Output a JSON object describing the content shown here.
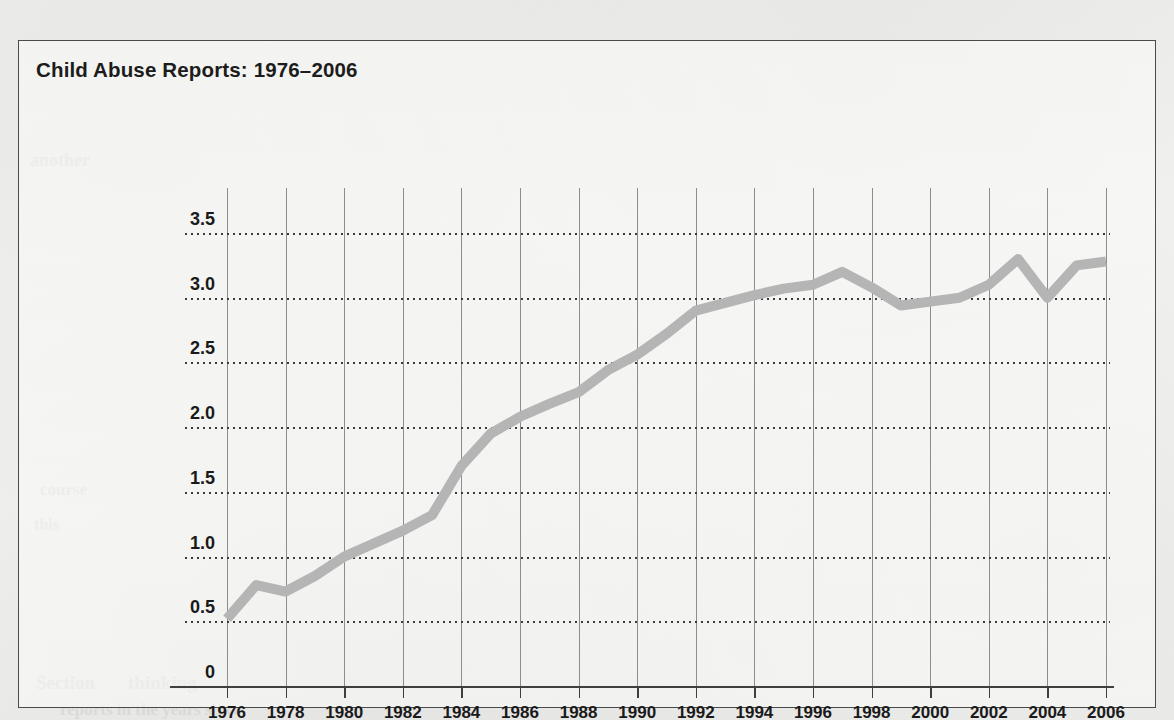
{
  "figure": {
    "title": "Child Abuse Reports: 1976–2006",
    "border_color": "#4a4a4a",
    "page_background": "#f2f2f0"
  },
  "bleed_through_text": [
    {
      "text": "Section",
      "x": 36,
      "y": 672,
      "size": 19
    },
    {
      "text": "thinking",
      "x": 128,
      "y": 672,
      "size": 19
    },
    {
      "text": "reports in the years since",
      "x": 60,
      "y": 700,
      "size": 17
    },
    {
      "text": "another",
      "x": 30,
      "y": 150,
      "size": 18
    },
    {
      "text": "course",
      "x": 40,
      "y": 480,
      "size": 17
    },
    {
      "text": "this",
      "x": 34,
      "y": 516,
      "size": 16
    }
  ],
  "chart_data": {
    "type": "line",
    "title": "Child Abuse Reports: 1976–2006",
    "xlabel": "",
    "ylabel": "Reported cases (in millions)",
    "xlim": [
      1976,
      2006
    ],
    "ylim": [
      0,
      3.5
    ],
    "grid": "horizontal-dotted-and-vertical-solid",
    "legend": "none",
    "line_color": "#b5b5b5",
    "line_width_px": 10,
    "markers": "none",
    "y_ticks": [
      "0",
      "0.5",
      "1.0",
      "1.5",
      "2.0",
      "2.5",
      "3.0",
      "3.5"
    ],
    "y_tick_values": [
      0,
      0.5,
      1.0,
      1.5,
      2.0,
      2.5,
      3.0,
      3.5
    ],
    "x_ticks": [
      "1976",
      "1978",
      "1980",
      "1982",
      "1984",
      "1986",
      "1988",
      "1990",
      "1992",
      "1994",
      "1996",
      "1998",
      "2000",
      "2002",
      "2004",
      "2006"
    ],
    "x_tick_values": [
      1976,
      1978,
      1980,
      1982,
      1984,
      1986,
      1988,
      1990,
      1992,
      1994,
      1996,
      1998,
      2000,
      2002,
      2004,
      2006
    ],
    "x": [
      1976,
      1977,
      1978,
      1979,
      1980,
      1981,
      1982,
      1983,
      1984,
      1985,
      1986,
      1987,
      1988,
      1989,
      1990,
      1991,
      1992,
      1993,
      1994,
      1995,
      1996,
      1997,
      1998,
      1999,
      2000,
      2001,
      2002,
      2003,
      2004,
      2005,
      2006
    ],
    "values": [
      0.52,
      0.78,
      0.73,
      0.85,
      1.0,
      1.1,
      1.2,
      1.32,
      1.7,
      1.95,
      2.08,
      2.18,
      2.27,
      2.44,
      2.56,
      2.72,
      2.9,
      2.96,
      3.02,
      3.07,
      3.1,
      3.2,
      3.08,
      2.94,
      2.97,
      3.0,
      3.1,
      3.3,
      3.0,
      3.25,
      3.28
    ],
    "series": [
      {
        "name": "Reported cases (in millions)",
        "values": [
          0.52,
          0.78,
          0.73,
          0.85,
          1.0,
          1.1,
          1.2,
          1.32,
          1.7,
          1.95,
          2.08,
          2.18,
          2.27,
          2.44,
          2.56,
          2.72,
          2.9,
          2.96,
          3.02,
          3.07,
          3.1,
          3.2,
          3.08,
          2.94,
          2.97,
          3.0,
          3.1,
          3.3,
          3.0,
          3.25,
          3.28
        ]
      }
    ]
  }
}
